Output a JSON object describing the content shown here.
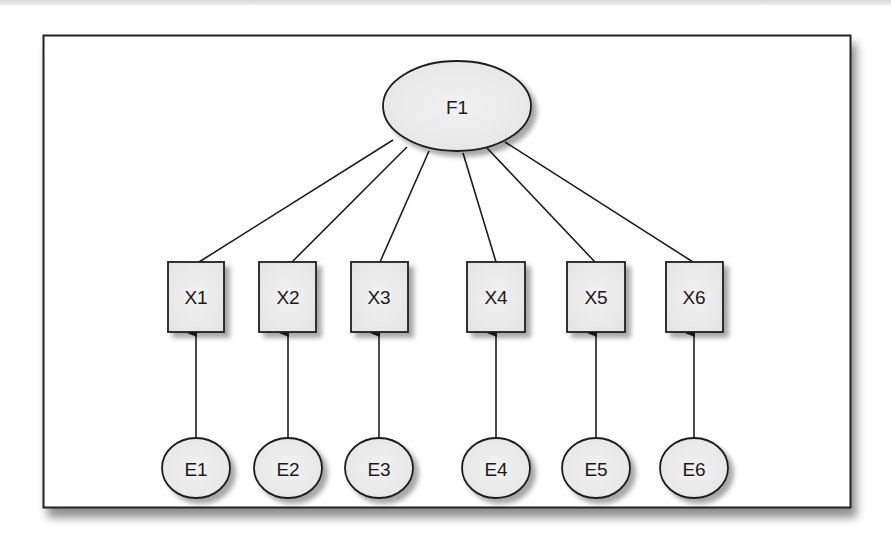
{
  "diagram": {
    "type": "confirmatory factor analysis path diagram",
    "factor": {
      "id": "F1",
      "label": "F1",
      "cx": 457,
      "cy": 106,
      "rx": 74,
      "ry": 45
    },
    "indicators": [
      {
        "id": "X1",
        "label": "X1",
        "x": 168,
        "cx": 196,
        "line_start": [
          393,
          140
        ],
        "line_end": [
          199,
          262
        ]
      },
      {
        "id": "X2",
        "label": "X2",
        "x": 259,
        "cx": 288,
        "line_start": [
          407,
          147
        ],
        "line_end": [
          292,
          262
        ]
      },
      {
        "id": "X3",
        "label": "X3",
        "x": 351,
        "cx": 379,
        "line_start": [
          429,
          151
        ],
        "line_end": [
          380,
          262
        ]
      },
      {
        "id": "X4",
        "label": "X4",
        "x": 467,
        "cx": 496,
        "line_start": [
          463,
          153
        ],
        "line_end": [
          496,
          262
        ]
      },
      {
        "id": "X5",
        "label": "X5",
        "x": 567,
        "cx": 596,
        "line_start": [
          487,
          148
        ],
        "line_end": [
          595,
          262
        ]
      },
      {
        "id": "X6",
        "label": "X6",
        "x": 666,
        "cx": 694,
        "line_start": [
          505,
          142
        ],
        "line_end": [
          693,
          262
        ]
      }
    ],
    "errors": [
      {
        "id": "E1",
        "label": "E1",
        "cx": 196
      },
      {
        "id": "E2",
        "label": "E2",
        "cx": 288
      },
      {
        "id": "E3",
        "label": "E3",
        "cx": 379
      },
      {
        "id": "E4",
        "label": "E4",
        "cx": 496
      },
      {
        "id": "E5",
        "label": "E5",
        "cx": 596
      },
      {
        "id": "E6",
        "label": "E6",
        "cx": 694
      }
    ],
    "edges": [
      {
        "from": "F1",
        "to": "X1",
        "style": "line"
      },
      {
        "from": "F1",
        "to": "X2",
        "style": "line"
      },
      {
        "from": "F1",
        "to": "X3",
        "style": "line"
      },
      {
        "from": "F1",
        "to": "X4",
        "style": "line"
      },
      {
        "from": "F1",
        "to": "X5",
        "style": "line"
      },
      {
        "from": "F1",
        "to": "X6",
        "style": "line"
      },
      {
        "from": "E1",
        "to": "X1",
        "style": "arrow"
      },
      {
        "from": "E2",
        "to": "X2",
        "style": "arrow"
      },
      {
        "from": "E3",
        "to": "X3",
        "style": "arrow"
      },
      {
        "from": "E4",
        "to": "X4",
        "style": "arrow"
      },
      {
        "from": "E5",
        "to": "X5",
        "style": "arrow"
      },
      {
        "from": "E6",
        "to": "X6",
        "style": "arrow"
      }
    ],
    "colors": {
      "node_fill": "#ececec",
      "stroke": "#1e1e1e",
      "shadow": "#b8b8b8",
      "frame_bg": "#ffffff"
    }
  }
}
